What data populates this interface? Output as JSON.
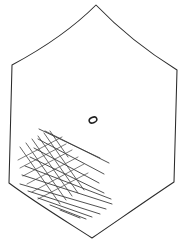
{
  "figure": {
    "type": "line-drawing",
    "background_color": "#ffffff",
    "width": 186,
    "height": 246
  },
  "outline": {
    "name": "shield-outline",
    "stroke_color": "#2b2b2b",
    "fill_color": "#ffffff",
    "stroke_width": 1.05,
    "vertices": [
      {
        "label": "apex-top",
        "x": 96,
        "y": 5
      },
      {
        "label": "shoulder-right",
        "x": 177,
        "y": 70
      },
      {
        "label": "corner-bottom-right",
        "x": 174,
        "y": 182
      },
      {
        "label": "vertex-bottom",
        "x": 92,
        "y": 238
      },
      {
        "label": "corner-bottom-left",
        "x": 9,
        "y": 183
      },
      {
        "label": "shoulder-left",
        "x": 12,
        "y": 65
      }
    ],
    "path": "M 96 5 C 118 28 148 52 177 70 C 176 105 175 148 174 182 C 147 200 117 221 92 238 C 64 220 33 201 9 183 C 10 146 11 103 12 65 C 40 50 72 29 96 5 Z",
    "edge_styles": [
      {
        "edge": "apex-to-shoulder-right",
        "curvature": "concave"
      },
      {
        "edge": "shoulder-left-to-apex",
        "curvature": "concave"
      },
      {
        "edge": "right-vertical",
        "curvature": "near-straight"
      },
      {
        "edge": "left-vertical",
        "curvature": "near-straight"
      },
      {
        "edge": "bottom-right",
        "curvature": "near-straight"
      },
      {
        "edge": "bottom-left",
        "curvature": "slight"
      }
    ]
  },
  "center_marker": {
    "name": "center-oval-marker",
    "cx": 93,
    "cy": 120,
    "rx": 4.0,
    "ry": 2.7,
    "rotation_deg": -25,
    "stroke_color": "#1f1f1f",
    "stroke_width": 1.5,
    "fill": "none"
  },
  "hatching": {
    "name": "crosshatch-region",
    "location": "lower-left",
    "description": "Crosshatched grid plus long parallel diagonal strokes",
    "primary_color": "#4a4a4a",
    "cross_color": "#5a5a5a",
    "long_color": "#3d3d3d",
    "grid_angle_deg": -35,
    "cross_angle_deg": 55,
    "grid_lines": [
      {
        "x1": 20,
        "y1": 147,
        "x2": 60,
        "y2": 204
      },
      {
        "x1": 26,
        "y1": 143,
        "x2": 66,
        "y2": 200
      },
      {
        "x1": 32,
        "y1": 139,
        "x2": 72,
        "y2": 196
      },
      {
        "x1": 38,
        "y1": 136,
        "x2": 78,
        "y2": 193
      },
      {
        "x1": 44,
        "y1": 133,
        "x2": 84,
        "y2": 190
      },
      {
        "x1": 50,
        "y1": 131,
        "x2": 68,
        "y2": 157
      }
    ],
    "cross_lines": [
      {
        "x1": 18,
        "y1": 160,
        "x2": 62,
        "y2": 137
      },
      {
        "x1": 20,
        "y1": 168,
        "x2": 66,
        "y2": 144
      },
      {
        "x1": 23,
        "y1": 176,
        "x2": 72,
        "y2": 150
      },
      {
        "x1": 27,
        "y1": 184,
        "x2": 78,
        "y2": 157
      },
      {
        "x1": 32,
        "y1": 192,
        "x2": 84,
        "y2": 164
      },
      {
        "x1": 38,
        "y1": 199,
        "x2": 88,
        "y2": 173
      }
    ],
    "long_lines": [
      {
        "x1": 39,
        "y1": 129,
        "x2": 100,
        "y2": 158
      },
      {
        "x1": 45,
        "y1": 131,
        "x2": 109,
        "y2": 163
      },
      {
        "x1": 38,
        "y1": 139,
        "x2": 104,
        "y2": 174
      },
      {
        "x1": 34,
        "y1": 148,
        "x2": 99,
        "y2": 183
      },
      {
        "x1": 30,
        "y1": 157,
        "x2": 104,
        "y2": 193
      },
      {
        "x1": 25,
        "y1": 166,
        "x2": 111,
        "y2": 199
      },
      {
        "x1": 22,
        "y1": 175,
        "x2": 112,
        "y2": 204
      },
      {
        "x1": 20,
        "y1": 184,
        "x2": 106,
        "y2": 209
      },
      {
        "x1": 28,
        "y1": 191,
        "x2": 100,
        "y2": 214
      },
      {
        "x1": 38,
        "y1": 198,
        "x2": 92,
        "y2": 217
      },
      {
        "x1": 50,
        "y1": 205,
        "x2": 86,
        "y2": 219
      },
      {
        "x1": 60,
        "y1": 210,
        "x2": 80,
        "y2": 218
      }
    ]
  }
}
